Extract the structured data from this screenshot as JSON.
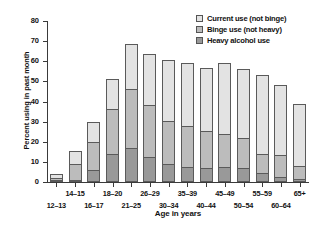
{
  "chart_data": {
    "type": "bar",
    "stacked": true,
    "title": "",
    "xlabel": "Age in years",
    "ylabel": "Percent using in past month",
    "ylim": [
      0,
      80
    ],
    "yticks": [
      0,
      10,
      20,
      30,
      40,
      50,
      60,
      70,
      80
    ],
    "grid": false,
    "legend_position": "top-right",
    "categories": [
      "12–13",
      "14–15",
      "16–17",
      "18–20",
      "21–25",
      "26–29",
      "30–34",
      "35–39",
      "40–44",
      "45–49",
      "50–54",
      "55–59",
      "60–64",
      "65+"
    ],
    "series": [
      {
        "name": "Heavy alcohol use",
        "color": "#999999",
        "values": [
          0.3,
          1.0,
          5.8,
          13.8,
          17.0,
          12.2,
          9.0,
          7.5,
          7.0,
          7.5,
          7.0,
          4.5,
          2.5,
          1.5
        ]
      },
      {
        "name": "Binge use (not heavy)",
        "color": "#bcbcbc",
        "values": [
          0.9,
          8.1,
          14.2,
          22.3,
          29.0,
          26.1,
          21.5,
          20.5,
          18.5,
          16.5,
          15.0,
          9.5,
          10.7,
          6.6
        ]
      },
      {
        "name": "Current use (not binge)",
        "color": "#e3e3e3",
        "values": [
          2.3,
          6.4,
          9.8,
          15.1,
          22.4,
          25.2,
          30.0,
          31.0,
          31.0,
          35.0,
          34.0,
          39.1,
          34.8,
          30.9
        ]
      }
    ],
    "totals": [
      3.5,
      15.5,
      29.8,
      51.2,
      68.4,
      63.5,
      60.5,
      59.0,
      56.5,
      59.0,
      56.0,
      53.1,
      48.0,
      39.0
    ]
  },
  "legend": {
    "items": [
      {
        "label": "Current use (not binge)",
        "swatch": "current"
      },
      {
        "label": "Binge use (not heavy)",
        "swatch": "binge"
      },
      {
        "label": "Heavy alcohol use",
        "swatch": "heavy"
      }
    ]
  },
  "axes": {
    "y_title": "Percent using in past month",
    "x_title": "Age in years",
    "y_tick_labels": [
      "0",
      "10",
      "20",
      "30",
      "40",
      "50",
      "60",
      "70",
      "80"
    ],
    "x_tick_labels": [
      "12–13",
      "14–15",
      "16–17",
      "18–20",
      "21–25",
      "26–29",
      "30–34",
      "35–39",
      "40–44",
      "45–49",
      "50–54",
      "55–59",
      "60–64",
      "65+"
    ]
  }
}
